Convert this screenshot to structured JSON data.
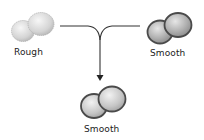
{
  "diagram": {
    "nodes": [
      {
        "id": "rough",
        "label": "Rough",
        "type": "unencapsulated",
        "position": "top-left"
      },
      {
        "id": "smooth_top",
        "label": "Smooth",
        "type": "encapsulated",
        "position": "top-right"
      },
      {
        "id": "smooth_result",
        "label": "Smooth",
        "type": "encapsulated",
        "position": "bottom-center"
      }
    ],
    "edges": [
      {
        "from": "rough",
        "to": "smooth_result",
        "style": "merge-line"
      },
      {
        "from": "smooth_top",
        "to": "smooth_result",
        "style": "merge-line"
      },
      {
        "arrow": "down",
        "target": "smooth_result"
      }
    ],
    "colors": {
      "rough_fill": "#d6d6d6",
      "smooth_fill": "#a9a9a9",
      "capsule_stroke": "#555555",
      "line": "#333333"
    }
  }
}
